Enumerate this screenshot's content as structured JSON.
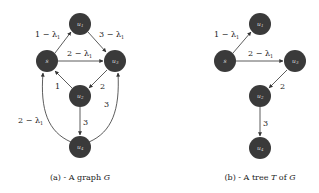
{
  "panels": [
    {
      "id": "a",
      "caption": "(a) - A graph G",
      "nodes": [
        {
          "id": "u1",
          "label": "u1",
          "x": 80,
          "y": 24
        },
        {
          "id": "s",
          "label": "s",
          "x": 47,
          "y": 61
        },
        {
          "id": "u3",
          "label": "u3",
          "x": 115,
          "y": 61
        },
        {
          "id": "u2",
          "label": "u2",
          "x": 80,
          "y": 96
        },
        {
          "id": "u4",
          "label": "u4",
          "x": 80,
          "y": 147
        }
      ],
      "edges": [
        {
          "from": "s",
          "to": "u1",
          "label": "1 − λ1"
        },
        {
          "from": "u1",
          "to": "u3",
          "label": "3 − λ1"
        },
        {
          "from": "s",
          "to": "u3",
          "label": "2 − λ1"
        },
        {
          "from": "u3",
          "to": "u2",
          "label": "2"
        },
        {
          "from": "u2",
          "to": "s",
          "label": "1"
        },
        {
          "from": "u2",
          "to": "u4",
          "label": "3"
        },
        {
          "from": "u4",
          "to": "s",
          "label": "2 − λ1"
        },
        {
          "from": "u4",
          "to": "u3",
          "label": "3"
        }
      ]
    },
    {
      "id": "b",
      "caption": "(b) - A tree T of G",
      "nodes": [
        {
          "id": "u1",
          "label": "u1",
          "x": 260,
          "y": 24
        },
        {
          "id": "s",
          "label": "s",
          "x": 225,
          "y": 61
        },
        {
          "id": "u3",
          "label": "u3",
          "x": 295,
          "y": 61
        },
        {
          "id": "u2",
          "label": "u2",
          "x": 260,
          "y": 96
        },
        {
          "id": "u4",
          "label": "u4",
          "x": 260,
          "y": 148
        }
      ],
      "edges": [
        {
          "from": "s",
          "to": "u1",
          "label": "1 − λ1"
        },
        {
          "from": "s",
          "to": "u3",
          "label": "2 − λ1"
        },
        {
          "from": "u3",
          "to": "u2",
          "label": "2"
        },
        {
          "from": "u2",
          "to": "u4",
          "label": "3"
        }
      ]
    }
  ],
  "labels": {
    "a": {
      "s_u1": "1 − λ",
      "u1_u3": "3 − λ",
      "s_u3": "2 − λ",
      "u3_u2": "2",
      "u2_s": "1",
      "u2_u4": "3",
      "u4_s": "2 − λ",
      "u4_u3": "3",
      "sub": "1",
      "caption_prefix": "(a) - A graph ",
      "caption_var": "G"
    },
    "b": {
      "s_u1": "1 − λ",
      "s_u3": "2 − λ",
      "u3_u2": "2",
      "u2_u4": "3",
      "sub": "1",
      "caption_prefix": "(b) - A tree ",
      "caption_var": "T",
      "caption_mid": " of ",
      "caption_var2": "G"
    },
    "nodes": {
      "u1": "u",
      "u1_sub": "1",
      "u2": "u",
      "u2_sub": "2",
      "u3": "u",
      "u3_sub": "3",
      "u4": "u",
      "u4_sub": "4",
      "s": "s"
    }
  }
}
